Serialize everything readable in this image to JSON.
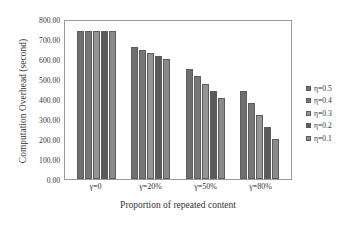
{
  "chart_data": {
    "type": "bar",
    "title": "",
    "xlabel": "Proportion of repeated content",
    "ylabel": "Computation Overhead (second)",
    "categories": [
      "γ=0",
      "γ=20%",
      "γ=50%",
      "γ=80%"
    ],
    "series": [
      {
        "name": "η=0.5",
        "color": "#6f6f6f",
        "values": [
          750,
          670,
          555,
          445
        ]
      },
      {
        "name": "η=0.4",
        "color": "#767676",
        "values": [
          750,
          655,
          520,
          385
        ]
      },
      {
        "name": "η=0.3",
        "color": "#949494",
        "values": [
          750,
          640,
          480,
          325
        ]
      },
      {
        "name": "η=0.2",
        "color": "#5a5a5a",
        "values": [
          750,
          625,
          445,
          265
        ]
      },
      {
        "name": "η=0.1",
        "color": "#8a8a8a",
        "values": [
          750,
          610,
          410,
          205
        ]
      }
    ],
    "ylim": [
      0,
      800
    ],
    "ytick_step": 100,
    "ytick_labels": [
      "0.00",
      "100.00",
      "200.00",
      "300.00",
      "400.00",
      "500.00",
      "600.00",
      "700.00",
      "800.00"
    ],
    "grid": false,
    "legend_position": "right",
    "frame": true
  }
}
